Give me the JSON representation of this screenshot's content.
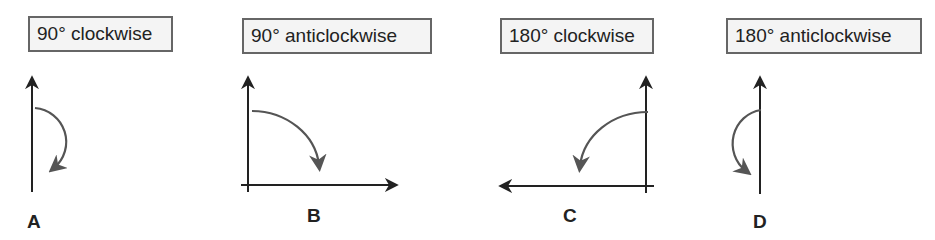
{
  "header": {
    "cut_off_text": "...g... , ... p..."
  },
  "options": [
    {
      "id": "A",
      "label": "90° clockwise"
    },
    {
      "id": "B",
      "label": "90° anticlockwise"
    },
    {
      "id": "C",
      "label": "180° clockwise"
    },
    {
      "id": "D",
      "label": "180° anticlockwise"
    }
  ],
  "diagrams": [
    {
      "letter": "A",
      "description": "vertical arrow with clockwise half-turn arc on the right"
    },
    {
      "letter": "B",
      "description": "up and right axes with quarter-turn clockwise arc"
    },
    {
      "letter": "C",
      "description": "up and left axes with quarter-turn anticlockwise arc"
    },
    {
      "letter": "D",
      "description": "vertical arrow with anticlockwise half-turn arc on the left"
    }
  ],
  "colors": {
    "axis": "#222222",
    "arc": "#555555",
    "box_border": "#666666",
    "box_fill": "#f4f4f4"
  }
}
